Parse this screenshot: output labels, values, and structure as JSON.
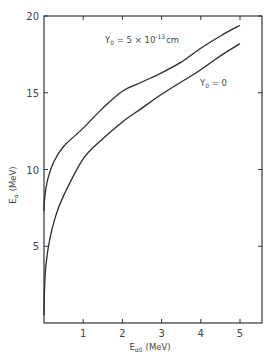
{
  "chart_data": {
    "type": "line",
    "title": "",
    "xlabel": "E_α0 (MeV)",
    "xlabel_main": "E",
    "xlabel_sub": "α0",
    "xlabel_unit": "(MeV)",
    "ylabel": "E_α (MeV)",
    "ylabel_main": "E",
    "ylabel_sub": "α",
    "ylabel_unit": "(MeV)",
    "xlim": [
      0,
      5.55
    ],
    "ylim": [
      0,
      20
    ],
    "xticks": [
      1,
      2,
      3,
      4,
      5
    ],
    "xtick_labels": [
      "1",
      "2",
      "3",
      "4",
      "5"
    ],
    "yticks": [
      5,
      10,
      15,
      20
    ],
    "ytick_labels": [
      "5",
      "10",
      "15",
      "20"
    ],
    "grid": false,
    "legend": "inline annotations",
    "series": [
      {
        "name": "Y0 = 5 × 10^-13 cm",
        "label_main": "Y",
        "label_sub": "0",
        "label_mid": " = 5 × 10",
        "label_sup": "-13",
        "label_end": "cm",
        "x": [
          0,
          0.02,
          0.1,
          0.25,
          0.5,
          1,
          1.5,
          2,
          2.5,
          3,
          3.5,
          4,
          4.5,
          5
        ],
        "y": [
          7.3,
          8.2,
          9.4,
          10.5,
          11.5,
          12.7,
          14.0,
          15.1,
          15.7,
          16.3,
          17.0,
          17.9,
          18.7,
          19.4
        ]
      },
      {
        "name": "Y0 = 0",
        "label_main": "Y",
        "label_sub": "0",
        "label_mid": " = 0",
        "x": [
          0,
          0.01,
          0.05,
          0.15,
          0.3,
          0.5,
          1,
          1.5,
          2,
          2.5,
          3,
          3.5,
          4,
          4.5,
          5
        ],
        "y": [
          0.5,
          2.0,
          3.8,
          5.5,
          7.0,
          8.3,
          10.7,
          12.0,
          13.1,
          14.0,
          14.9,
          15.7,
          16.5,
          17.4,
          18.2
        ]
      }
    ],
    "annotations": [
      {
        "text": "Y0 = 5 × 10^-13 cm",
        "x": 1.6,
        "y": 18.3
      },
      {
        "text": "Y0 = 0",
        "x": 4.2,
        "y": 15.5
      }
    ]
  }
}
